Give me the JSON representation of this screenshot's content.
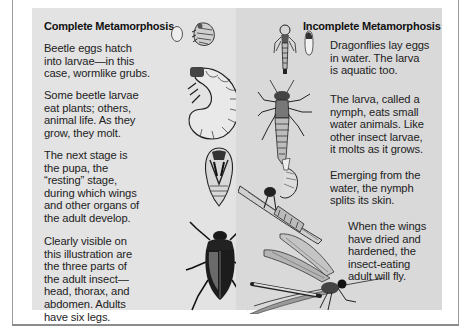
{
  "complete_metamorphosis": {
    "heading": "Complete Metamorphosis",
    "paragraphs": [
      "Beetle eggs hatch\ninto larvae—in this\ncase, wormlike grubs.",
      "Some beetle larvae\neat plants; others,\nanimal life. As they\ngrow, they molt.",
      "The next stage is\nthe pupa, the\n“resting” stage,\nduring which wings\nand other organs of\nthe adult develop.",
      "Clearly visible on\nthis illustration are\nthe three parts of\nthe adult insect—\nhead, thorax, and\nabdomen. Adults\nhave six legs."
    ],
    "illustrations": [
      "beetle-egg",
      "newly-hatched-larva",
      "beetle-grub",
      "beetle-pupa",
      "adult-beetle"
    ]
  },
  "incomplete_metamorphosis": {
    "heading": "Incomplete Metamorphosis",
    "paragraphs": [
      "Dragonflies lay eggs\nin water. The larva\nis aquatic too.",
      "The larva, called a\nnymph, eats small\nwater animals. Like\nother insect larvae,\nit molts as it grows.",
      "Emerging from the\nwater, the nymph\nsplits its skin.",
      "When the wings\nhave dried and\nhardened, the\ninsect-eating\nadult will fly."
    ],
    "illustrations": [
      "young-nymph",
      "dragonfly-egg",
      "dragonfly-nymph",
      "emerging-dragonfly",
      "adult-dragonfly"
    ]
  },
  "colors": {
    "page": "#ffffff",
    "left_panel": "#e3e3e3",
    "right_panel": "#d9d9d9",
    "frame": "#9a9a9a",
    "text": "#222222"
  }
}
